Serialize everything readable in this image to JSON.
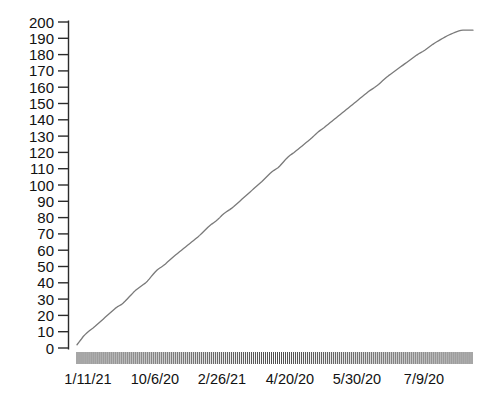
{
  "chart_data": {
    "type": "line",
    "title": "",
    "xlabel": "",
    "ylabel": "",
    "ylim": [
      0,
      200
    ],
    "ytick_step": 10,
    "grid": false,
    "legend": null,
    "line_color": "#7a7a7a",
    "axis_color": "#2b2b2b",
    "background": "#ffffff",
    "ytick_labels": [
      "200",
      "190",
      "180",
      "170",
      "160",
      "150",
      "140",
      "130",
      "120",
      "110",
      "100",
      "90",
      "80",
      "70",
      "60",
      "50",
      "40",
      "30",
      "20",
      "10",
      "0"
    ],
    "xtick_labels": [
      "1/11/21",
      "10/6/20",
      "2/26/21",
      "4/20/20",
      "5/30/20",
      "7/9/20"
    ],
    "xtick_label_positions": [
      88,
      155,
      222,
      290,
      357,
      424
    ],
    "x_minor_tick_count": 198,
    "series": [
      {
        "name": "cumulative",
        "values": [
          2.0,
          3.6,
          5.2,
          6.9,
          8.2,
          9.4,
          10.4,
          11.4,
          12.3,
          13.3,
          14.4,
          15.5,
          16.6,
          17.7,
          18.8,
          19.9,
          21.0,
          22.1,
          23.2,
          24.3,
          25.2,
          25.9,
          26.6,
          27.6,
          28.8,
          30.1,
          31.4,
          32.7,
          34.0,
          35.2,
          36.2,
          37.1,
          38.0,
          38.9,
          39.8,
          41.0,
          42.4,
          43.9,
          45.4,
          46.8,
          48.0,
          48.9,
          49.7,
          50.6,
          51.6,
          52.7,
          53.8,
          54.9,
          56.0,
          57.0,
          58.0,
          59.0,
          60.0,
          61.0,
          62.0,
          63.0,
          64.0,
          65.0,
          66.0,
          67.0,
          68.0,
          69.1,
          70.3,
          71.5,
          72.7,
          73.9,
          75.0,
          76.0,
          76.9,
          77.8,
          78.8,
          80.0,
          81.3,
          82.4,
          83.3,
          84.1,
          84.9,
          85.8,
          86.8,
          87.9,
          89.0,
          90.1,
          91.2,
          92.3,
          93.4,
          94.5,
          95.6,
          96.7,
          97.8,
          98.9,
          100.0,
          101.1,
          102.2,
          103.4,
          104.6,
          105.8,
          107.0,
          108.1,
          109.0,
          109.8,
          110.6,
          111.8,
          113.2,
          114.6,
          116.0,
          117.2,
          118.2,
          119.1,
          120.0,
          121.0,
          122.0,
          123.0,
          124.0,
          125.0,
          126.0,
          127.0,
          128.0,
          129.1,
          130.3,
          131.5,
          132.6,
          133.5,
          134.4,
          135.3,
          136.3,
          137.3,
          138.3,
          139.3,
          140.3,
          141.3,
          142.3,
          143.3,
          144.3,
          145.3,
          146.3,
          147.3,
          148.3,
          149.3,
          150.3,
          151.3,
          152.3,
          153.3,
          154.3,
          155.3,
          156.3,
          157.3,
          158.2,
          159.0,
          159.8,
          160.7,
          161.7,
          162.8,
          163.9,
          165.0,
          166.1,
          167.1,
          168.0,
          168.9,
          169.8,
          170.7,
          171.6,
          172.5,
          173.4,
          174.3,
          175.2,
          176.1,
          177.0,
          177.9,
          178.8,
          179.7,
          180.5,
          181.2,
          181.9,
          182.7,
          183.6,
          184.5,
          185.4,
          186.3,
          187.1,
          187.9,
          188.6,
          189.3,
          190.0,
          190.7,
          191.4,
          192.0,
          192.6,
          193.1,
          193.6,
          194.1,
          194.5,
          194.8,
          195.0,
          195.0,
          195.0,
          195.0,
          195.0,
          195.0
        ]
      }
    ]
  }
}
